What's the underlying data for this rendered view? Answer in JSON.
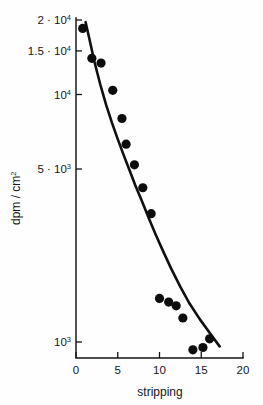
{
  "chart_data": {
    "type": "scatter",
    "title": "",
    "xlabel": "stripping",
    "ylabel": "dpm/cm2",
    "ylabel_display": "dpm / cm",
    "ylabel_exponent": "2",
    "yscale": "log",
    "xscale": "linear",
    "xlim": [
      0,
      20
    ],
    "ylim": [
      850,
      20000
    ],
    "grid": false,
    "legend": false,
    "xticks": [
      {
        "value": 0,
        "label": "0"
      },
      {
        "value": 5,
        "label": "5"
      },
      {
        "value": 10,
        "label": "10"
      },
      {
        "value": 15,
        "label": "15"
      },
      {
        "value": 20,
        "label": "20"
      }
    ],
    "yticks": [
      {
        "value": 20000,
        "mantissa": "2",
        "separator": "·",
        "base": "10",
        "exponent": "4"
      },
      {
        "value": 15000,
        "mantissa": "1.5",
        "separator": "·",
        "base": "10",
        "exponent": "4"
      },
      {
        "value": 10000,
        "mantissa": "",
        "separator": "",
        "base": "10",
        "exponent": "4"
      },
      {
        "value": 5000,
        "mantissa": "5",
        "separator": "·",
        "base": "10",
        "exponent": "3"
      },
      {
        "value": 1000,
        "mantissa": "",
        "separator": "",
        "base": "10",
        "exponent": "3"
      }
    ],
    "series": [
      {
        "name": "measured activity",
        "marker": "filled-circle",
        "color": "#0d0d0d",
        "x": [
          0.8,
          1.9,
          3.0,
          4.4,
          5.5,
          6.0,
          7.0,
          8.0,
          9.0,
          10.0,
          11.1,
          12.0,
          12.8,
          14.0,
          15.2,
          16.0
        ],
        "y": [
          18500,
          14000,
          13400,
          10400,
          8000,
          6300,
          5200,
          4200,
          3300,
          1500,
          1450,
          1400,
          1250,
          930,
          950,
          1030
        ]
      }
    ],
    "fit_curve": {
      "name": "fitted decay curve",
      "color": "#101010",
      "x": [
        1.15,
        1.6,
        2.2,
        2.9,
        3.6,
        4.3,
        5.0,
        5.7,
        6.4,
        7.1,
        7.9,
        8.7,
        9.5,
        10.4,
        11.4,
        12.5,
        13.6,
        14.8,
        16.0,
        17.2
      ],
      "y": [
        19600,
        16800,
        13600,
        11000,
        9100,
        7700,
        6600,
        5700,
        4950,
        4300,
        3700,
        3180,
        2740,
        2340,
        1980,
        1670,
        1430,
        1240,
        1090,
        960
      ]
    }
  },
  "geometry": {
    "plot_left": 76,
    "plot_right": 243,
    "plot_bottom": 358,
    "y_pixel_at_20000": 20,
    "y_pixel_at_1000": 342,
    "tick_length": 6,
    "marker_radius": 4.6
  }
}
